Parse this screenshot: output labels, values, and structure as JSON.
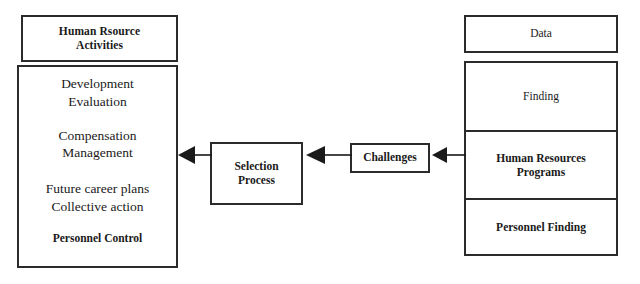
{
  "diagram": {
    "background_color": "#ffffff",
    "line_color": "#2b2b2b",
    "text_color": "#1a1a1a"
  },
  "left_column": {
    "header_box": {
      "label": "Human Rsource\nActivities"
    },
    "activities_box": {
      "groups": [
        {
          "lines": [
            "Development",
            "Evaluation"
          ]
        },
        {
          "lines": [
            "Compensation",
            "Management"
          ]
        },
        {
          "lines": [
            "Future career plans",
            "Collective action"
          ]
        },
        {
          "lines": [
            "Personnel Control"
          ]
        }
      ]
    }
  },
  "middle": {
    "selection_process_box": {
      "label": "Selection\nProcess"
    },
    "challenges_box": {
      "label": "Challenges"
    }
  },
  "right_column": {
    "data_box": {
      "label": "Data"
    },
    "stack": [
      {
        "label": "Finding"
      },
      {
        "label": "Human Resources\nPrograms"
      },
      {
        "label": "Personnel Finding"
      }
    ]
  },
  "connectors": [
    {
      "name": "challenges-to-right-stack",
      "direction": "left",
      "from": "Human Resources Programs",
      "to": "Challenges"
    },
    {
      "name": "selection-to-challenges",
      "direction": "left",
      "from": "Challenges",
      "to": "Selection Process"
    },
    {
      "name": "left-to-selection",
      "direction": "left",
      "from": "Selection Process",
      "to": "Human Resource Activities"
    }
  ]
}
